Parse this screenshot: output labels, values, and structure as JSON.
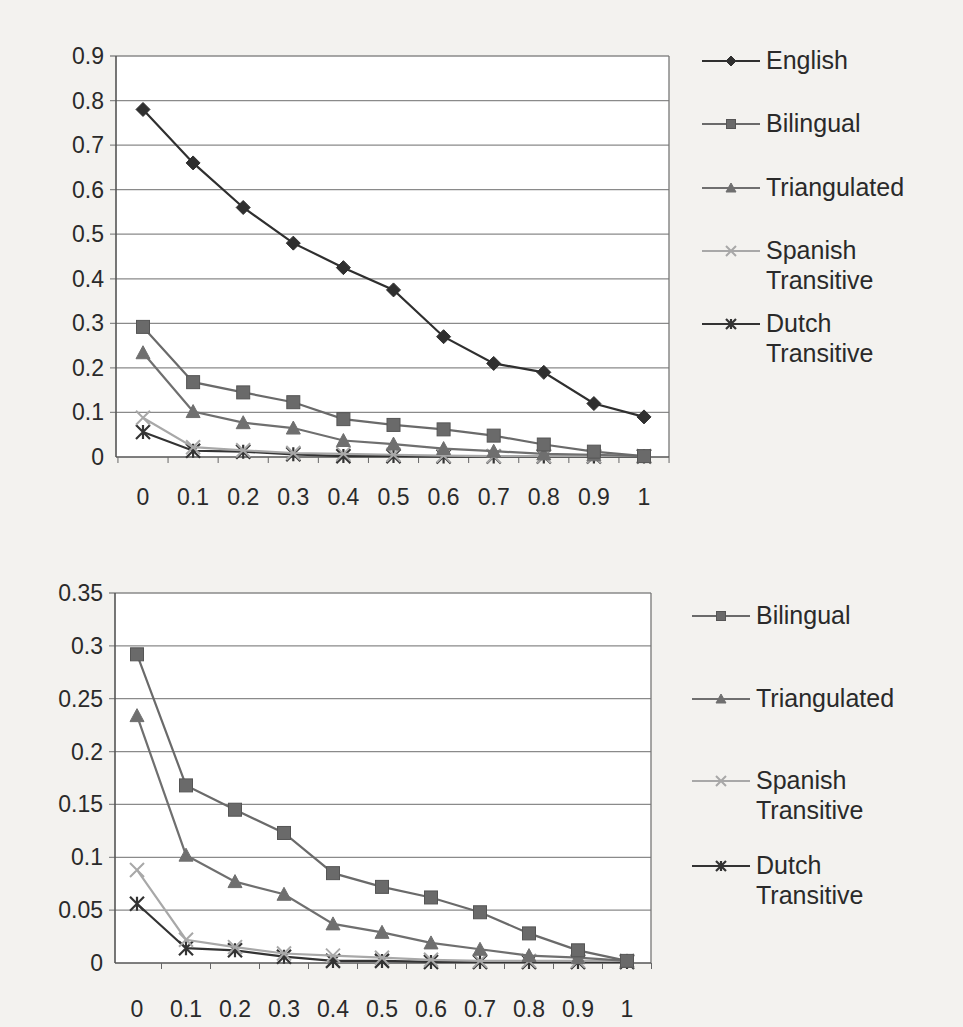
{
  "chart_data": [
    {
      "type": "line",
      "title": "",
      "xlabel": "",
      "ylabel": "",
      "categories": [
        "0",
        "0.1",
        "0.2",
        "0.3",
        "0.4",
        "0.5",
        "0.6",
        "0.7",
        "0.8",
        "0.9",
        "1"
      ],
      "ylim": [
        0,
        0.9
      ],
      "yticks": [
        "0",
        "0.1",
        "0.2",
        "0.3",
        "0.4",
        "0.5",
        "0.6",
        "0.7",
        "0.8",
        "0.9"
      ],
      "grid": true,
      "legend_position": "right",
      "series": [
        {
          "name": "English",
          "marker": "diamond",
          "color": "#2f2f2f",
          "values": [
            0.78,
            0.66,
            0.56,
            0.48,
            0.425,
            0.375,
            0.27,
            0.21,
            0.19,
            0.12,
            0.09
          ]
        },
        {
          "name": "Bilingual",
          "marker": "square",
          "color": "#6a6a6a",
          "values": [
            0.292,
            0.168,
            0.145,
            0.123,
            0.085,
            0.072,
            0.062,
            0.048,
            0.028,
            0.012,
            0.002
          ]
        },
        {
          "name": "Triangulated",
          "marker": "triangle",
          "color": "#6f6f6f",
          "values": [
            0.234,
            0.102,
            0.077,
            0.065,
            0.037,
            0.029,
            0.019,
            0.013,
            0.007,
            0.005,
            0.002
          ]
        },
        {
          "name": "Spanish\nTransitive",
          "marker": "x",
          "color": "#a8a8a8",
          "values": [
            0.088,
            0.022,
            0.015,
            0.009,
            0.007,
            0.005,
            0.003,
            0.002,
            0.002,
            0.002,
            0.002
          ]
        },
        {
          "name": "Dutch\nTransitive",
          "marker": "asterisk",
          "color": "#333333",
          "values": [
            0.056,
            0.014,
            0.012,
            0.006,
            0.002,
            0.002,
            0.001,
            0.001,
            0.001,
            0.001,
            0.001
          ]
        }
      ]
    },
    {
      "type": "line",
      "title": "",
      "xlabel": "",
      "ylabel": "",
      "categories": [
        "0",
        "0.1",
        "0.2",
        "0.3",
        "0.4",
        "0.5",
        "0.6",
        "0.7",
        "0.8",
        "0.9",
        "1"
      ],
      "ylim": [
        0,
        0.35
      ],
      "yticks": [
        "0",
        "0.05",
        "0.1",
        "0.15",
        "0.2",
        "0.25",
        "0.3",
        "0.35"
      ],
      "grid": true,
      "legend_position": "right",
      "series": [
        {
          "name": "Bilingual",
          "marker": "square",
          "color": "#6a6a6a",
          "values": [
            0.292,
            0.168,
            0.145,
            0.123,
            0.085,
            0.072,
            0.062,
            0.048,
            0.028,
            0.012,
            0.002
          ]
        },
        {
          "name": "Triangulated",
          "marker": "triangle",
          "color": "#6f6f6f",
          "values": [
            0.234,
            0.102,
            0.077,
            0.065,
            0.037,
            0.029,
            0.019,
            0.013,
            0.007,
            0.005,
            0.002
          ]
        },
        {
          "name": "Spanish\nTransitive",
          "marker": "x",
          "color": "#a8a8a8",
          "values": [
            0.088,
            0.022,
            0.015,
            0.009,
            0.007,
            0.005,
            0.003,
            0.002,
            0.002,
            0.002,
            0.002
          ]
        },
        {
          "name": "Dutch\nTransitive",
          "marker": "asterisk",
          "color": "#333333",
          "values": [
            0.056,
            0.014,
            0.012,
            0.006,
            0.002,
            0.002,
            0.001,
            0.001,
            0.001,
            0.001,
            0.001
          ]
        }
      ]
    }
  ],
  "layout": {
    "charts": [
      {
        "top": 0,
        "height": 520,
        "plot": {
          "left": 116,
          "top": 56,
          "right": 669,
          "bottom": 457
        },
        "x0": 143,
        "dx": 50.1,
        "xlabel_y": 505,
        "legend": {
          "left": 700,
          "top": 45,
          "row_gap": [
            0,
            63,
            127,
            190,
            263
          ]
        }
      },
      {
        "top": 520,
        "height": 507,
        "plot": {
          "left": 115,
          "top": 73,
          "right": 651,
          "bottom": 443
        },
        "x0": 137,
        "dx": 49,
        "xlabel_y": 497,
        "legend": {
          "left": 690,
          "top": 80,
          "row_gap": [
            0,
            83,
            165,
            250
          ]
        }
      }
    ]
  }
}
